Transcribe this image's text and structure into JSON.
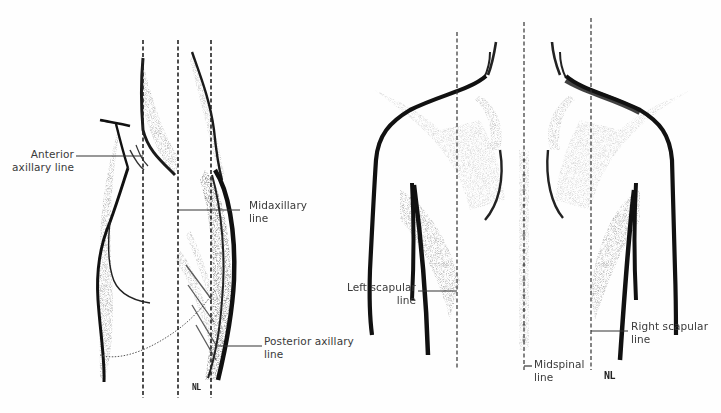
{
  "figures": {
    "lateral": {
      "description": "Lateral view of torso with axillary reference lines",
      "signature": "NL",
      "labels": {
        "anterior_axillary": [
          "Anterior",
          "axillary line"
        ],
        "midaxillary": [
          "Midaxillary",
          "line"
        ],
        "posterior_axillary": [
          "Posterior axillary",
          "line"
        ]
      }
    },
    "posterior": {
      "description": "Posterior view of back with scapular and spinal reference lines",
      "signature": "NL",
      "labels": {
        "left_scapular": [
          "Left scapular",
          "line"
        ],
        "midspinal": [
          "Midspinal",
          "line"
        ],
        "right_scapular": [
          "Right scapular",
          "line"
        ]
      }
    }
  },
  "colors": {
    "ink": "#1a1a1a",
    "text": "#3a3a3a",
    "background": "#fefefe"
  }
}
